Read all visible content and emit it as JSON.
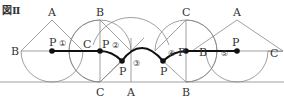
{
  "figure": {
    "title": "図Ⅱ",
    "colors": {
      "line": "#888888",
      "path": "#111111",
      "text": "#333333"
    },
    "labels": {
      "A1": "A",
      "B1": "B",
      "C1": "C",
      "P1": "P",
      "n1": "①",
      "B2": "B",
      "C2": "C",
      "P2": "P",
      "n2": "②",
      "P3": "P",
      "n3": "③",
      "A3": "A",
      "P4": "P",
      "n4": "④",
      "C4": "C",
      "B4": "B",
      "Pb": "P",
      "Bm": "B",
      "A5": "A",
      "C5": "C",
      "P5": "P",
      "n5": "⑤"
    }
  }
}
